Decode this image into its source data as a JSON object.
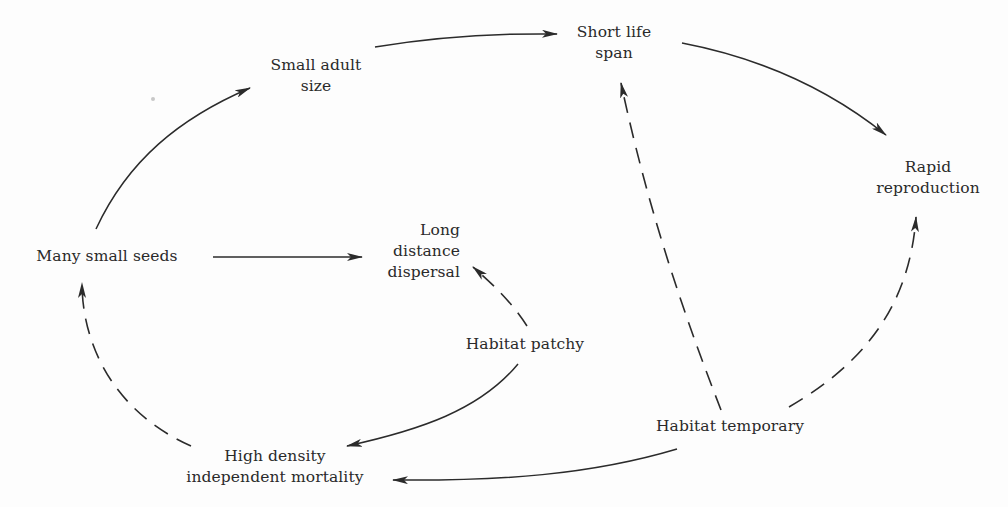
{
  "diagram": {
    "type": "causal-flow-diagram",
    "legend_implicit": {
      "solid_arrow": "direct consequence",
      "dashed_arrow": "contributing habitat factor"
    },
    "nodes": {
      "small_adult_size": {
        "lines": [
          "Small adult",
          "size"
        ]
      },
      "short_life_span": {
        "lines": [
          "Short life",
          "span"
        ]
      },
      "rapid_reproduction": {
        "lines": [
          "Rapid",
          "reproduction"
        ]
      },
      "many_small_seeds": {
        "lines": [
          "Many small seeds"
        ]
      },
      "long_distance_dispersal": {
        "lines": [
          "Long",
          "distance",
          "dispersal"
        ]
      },
      "habitat_patchy": {
        "lines": [
          "Habitat patchy"
        ]
      },
      "habitat_temporary": {
        "lines": [
          "Habitat temporary"
        ]
      },
      "high_density_independent_mortality": {
        "lines": [
          "High density",
          "independent mortality"
        ]
      }
    },
    "edges": [
      {
        "from": "Many small seeds",
        "to": "Small adult size",
        "style": "solid"
      },
      {
        "from": "Small adult size",
        "to": "Short life span",
        "style": "solid"
      },
      {
        "from": "Short life span",
        "to": "Rapid reproduction",
        "style": "solid"
      },
      {
        "from": "Many small seeds",
        "to": "Long distance dispersal",
        "style": "solid"
      },
      {
        "from": "Habitat patchy",
        "to": "Long distance dispersal",
        "style": "dashed"
      },
      {
        "from": "Habitat patchy",
        "to": "High density independent mortality",
        "style": "solid"
      },
      {
        "from": "High density independent mortality",
        "to": "Many small seeds",
        "style": "dashed"
      },
      {
        "from": "Habitat temporary",
        "to": "Short life span",
        "style": "dashed"
      },
      {
        "from": "Habitat temporary",
        "to": "Rapid reproduction",
        "style": "dashed"
      },
      {
        "from": "Habitat temporary",
        "to": "High density independent mortality",
        "style": "solid"
      }
    ],
    "colors": {
      "ink": "#2b2b2b",
      "background": "#fdfdfd"
    }
  }
}
